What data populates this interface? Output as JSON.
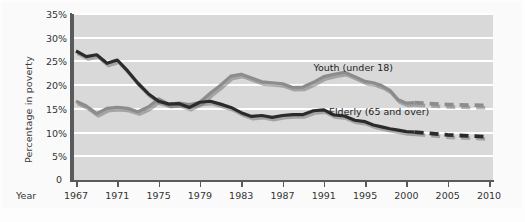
{
  "chart_data": {
    "type": "line",
    "title": "",
    "xlabel": "Year",
    "ylabel": "Percentage in poverty",
    "xlim": [
      1967,
      2010
    ],
    "ylim": [
      0,
      35
    ],
    "ytick_labels": [
      "35%",
      "30%",
      "25%",
      "20%",
      "15%",
      "10%",
      "5%",
      "0"
    ],
    "ytick_values": [
      35,
      30,
      25,
      20,
      15,
      10,
      5,
      0
    ],
    "xtick_labels": [
      "1967",
      "1971",
      "1975",
      "1979",
      "1983",
      "1987",
      "1991",
      "1995",
      "2000",
      "2005",
      "2010"
    ],
    "xtick_values": [
      1967,
      1971,
      1975,
      1979,
      1983,
      1987,
      1991,
      1995,
      2000,
      2005,
      2010
    ],
    "grid": "horizontal",
    "legend_position": "inline-annotations",
    "series": [
      {
        "name": "Youth (under 18)",
        "color": "#8c8c8c",
        "label_x": 1990.0,
        "label_y": 23.6,
        "x": [
          1967,
          1968,
          1969,
          1970,
          1971,
          1972,
          1973,
          1974,
          1975,
          1976,
          1977,
          1978,
          1979,
          1980,
          1981,
          1982,
          1983,
          1984,
          1985,
          1986,
          1987,
          1988,
          1989,
          1990,
          1991,
          1992,
          1993,
          1994,
          1995,
          1996,
          1997,
          1998,
          1999,
          2000,
          2001
        ],
        "values": [
          16.6,
          15.6,
          14.0,
          15.1,
          15.3,
          15.1,
          14.4,
          15.4,
          17.1,
          16.0,
          16.2,
          15.9,
          16.4,
          18.3,
          20.0,
          21.9,
          22.3,
          21.5,
          20.7,
          20.5,
          20.3,
          19.5,
          19.6,
          20.6,
          21.8,
          22.3,
          22.7,
          21.8,
          20.8,
          20.5,
          19.9,
          18.9,
          16.9,
          16.2,
          16.3
        ]
      },
      {
        "name": "Youth (under 18) projected",
        "color": "#8c8c8c",
        "style": "dashed",
        "x": [
          2001,
          2005,
          2010
        ],
        "values": [
          16.3,
          15.9,
          15.7
        ]
      },
      {
        "name": "Elderly (65 and over)",
        "color": "#2b2b2b",
        "label_x": 1991.5,
        "label_y": 14.3,
        "x": [
          1967,
          1968,
          1969,
          1970,
          1971,
          1972,
          1973,
          1974,
          1975,
          1976,
          1977,
          1978,
          1979,
          1980,
          1981,
          1982,
          1983,
          1984,
          1985,
          1986,
          1987,
          1988,
          1989,
          1990,
          1991,
          1992,
          1993,
          1994,
          1995,
          1996,
          1997,
          1998,
          1999,
          2000,
          2001
        ],
        "values": [
          27.2,
          26.0,
          26.4,
          24.6,
          25.3,
          23.0,
          20.4,
          18.2,
          16.6,
          16.0,
          16.1,
          15.3,
          16.4,
          16.6,
          16.0,
          15.3,
          14.2,
          13.4,
          13.6,
          13.2,
          13.6,
          13.8,
          13.8,
          14.6,
          14.8,
          13.7,
          13.5,
          12.6,
          12.3,
          11.6,
          11.2,
          10.8,
          10.5,
          10.2,
          10.1
        ]
      },
      {
        "name": "Elderly (65 and over) projected",
        "color": "#2b2b2b",
        "style": "dashed",
        "x": [
          2001,
          2005,
          2010
        ],
        "values": [
          10.1,
          9.5,
          9.1
        ]
      }
    ]
  },
  "axis": {
    "year_label": "Year",
    "zero_label": "0"
  }
}
